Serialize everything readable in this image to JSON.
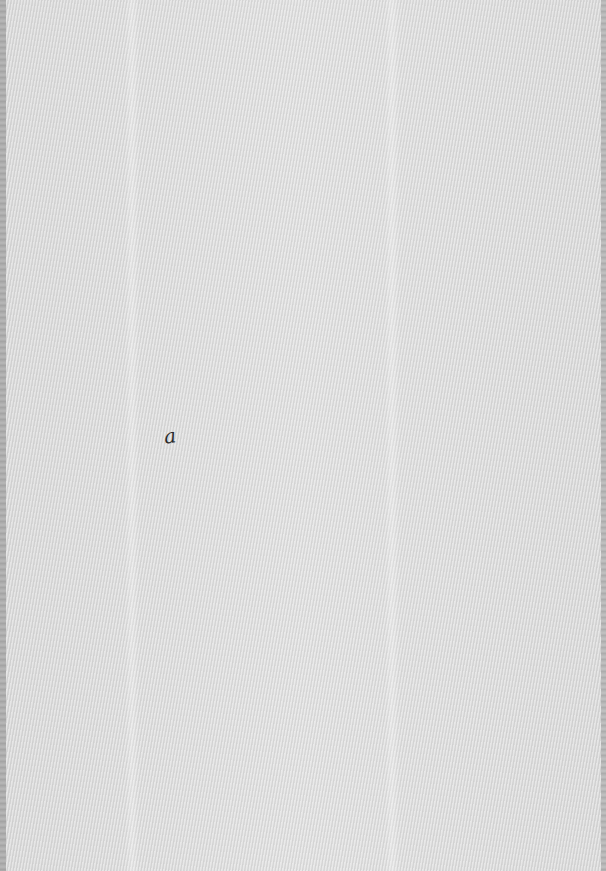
{
  "document": {
    "type": "scanned-blank-page",
    "background_color": "#dcdcdc",
    "marks": [
      {
        "text": "a",
        "x": 173,
        "y": 438
      }
    ]
  }
}
